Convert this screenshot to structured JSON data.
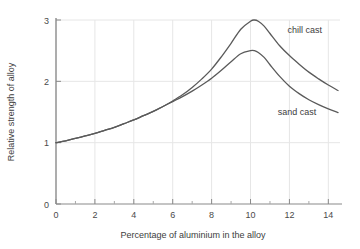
{
  "chart_data": {
    "type": "line",
    "title": "",
    "xlabel": "Percentage of aluminium in the alloy",
    "ylabel": "Relative strength of alloy",
    "xlim": [
      0,
      14.6
    ],
    "ylim": [
      0,
      3
    ],
    "xticks": [
      0,
      2,
      4,
      6,
      8,
      10,
      12,
      14
    ],
    "xtick_labels": [
      "0",
      "2",
      "4",
      "6",
      "8",
      "10",
      "12",
      "14"
    ],
    "yticks": [
      0,
      1,
      2,
      3
    ],
    "ytick_labels": [
      "0",
      "1",
      "2",
      "3"
    ],
    "x_minor_ticks": [
      1,
      3,
      5,
      7,
      9,
      11,
      13
    ],
    "grid": "both",
    "grid_color": "#e6e6e6",
    "legend_position": "inline-annotations",
    "line_color": "#5a5a5a",
    "axis_color": "#8a8a8a",
    "background": "#ffffff",
    "series": [
      {
        "name": "chill cast",
        "label": "chill cast",
        "label_x": 11.9,
        "label_y": 2.78,
        "x": [
          0.0,
          0.5,
          1.0,
          1.5,
          2.0,
          2.5,
          3.0,
          3.5,
          4.0,
          4.5,
          5.0,
          5.5,
          6.0,
          6.5,
          7.0,
          7.5,
          8.0,
          8.5,
          9.0,
          9.5,
          10.0,
          10.2,
          10.4,
          10.7,
          11.0,
          11.5,
          12.0,
          12.5,
          13.0,
          13.5,
          14.0,
          14.5
        ],
        "y": [
          1.0,
          1.03,
          1.07,
          1.11,
          1.15,
          1.2,
          1.25,
          1.31,
          1.37,
          1.44,
          1.51,
          1.59,
          1.68,
          1.78,
          1.9,
          2.04,
          2.2,
          2.4,
          2.62,
          2.85,
          2.98,
          3.0,
          2.98,
          2.9,
          2.78,
          2.58,
          2.42,
          2.28,
          2.15,
          2.04,
          1.94,
          1.85
        ]
      },
      {
        "name": "sand cast",
        "label": "sand cast",
        "label_x": 11.4,
        "label_y": 1.45,
        "x": [
          0.0,
          0.5,
          1.0,
          1.5,
          2.0,
          2.5,
          3.0,
          3.5,
          4.0,
          4.5,
          5.0,
          5.5,
          6.0,
          6.5,
          7.0,
          7.5,
          8.0,
          8.5,
          9.0,
          9.5,
          10.0,
          10.2,
          10.4,
          10.7,
          11.0,
          11.5,
          12.0,
          12.5,
          13.0,
          13.5,
          14.0,
          14.5
        ],
        "y": [
          1.0,
          1.03,
          1.07,
          1.11,
          1.15,
          1.2,
          1.25,
          1.31,
          1.37,
          1.44,
          1.51,
          1.59,
          1.67,
          1.75,
          1.84,
          1.94,
          2.05,
          2.18,
          2.32,
          2.45,
          2.5,
          2.5,
          2.47,
          2.39,
          2.27,
          2.08,
          1.92,
          1.8,
          1.7,
          1.62,
          1.55,
          1.49
        ]
      }
    ]
  },
  "annotations": {
    "chill_cast_label": "chill cast",
    "sand_cast_label": "sand cast"
  }
}
